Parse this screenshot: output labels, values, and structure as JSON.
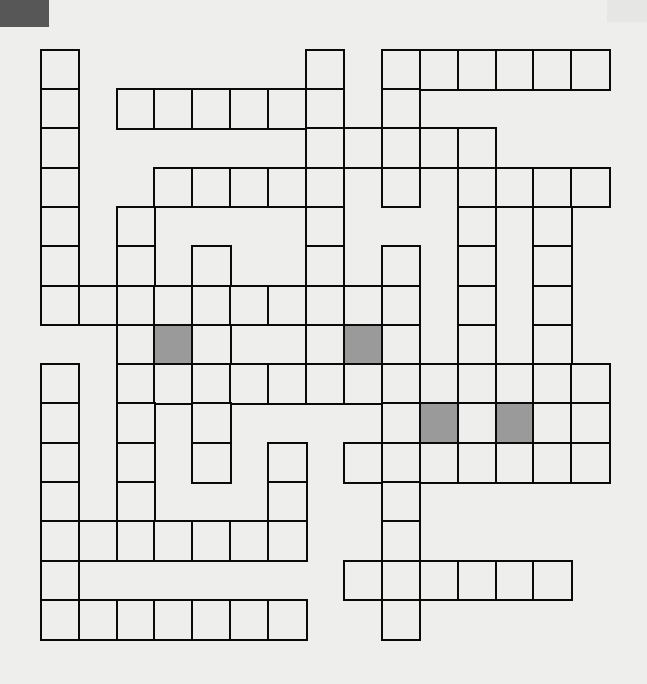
{
  "puzzle": {
    "type": "crossword",
    "rows": 15,
    "cols": 15,
    "origin": {
      "x": 41,
      "y": 50
    },
    "cell_width": 37.9,
    "cell_height": 39.3,
    "colors": {
      "background": "#eeeeec",
      "line": "#0a0a0a",
      "shaded": "#9a9a9a",
      "corner_mark": "#575757"
    },
    "grid": [
      {
        "row": 0,
        "cells": [
          0,
          7,
          9,
          10,
          11,
          12,
          13,
          14
        ],
        "shaded": []
      },
      {
        "row": 1,
        "cells": [
          0,
          2,
          3,
          4,
          5,
          6,
          7,
          9
        ],
        "shaded": []
      },
      {
        "row": 2,
        "cells": [
          0,
          7,
          8,
          9,
          10,
          11
        ],
        "shaded": []
      },
      {
        "row": 3,
        "cells": [
          0,
          3,
          4,
          5,
          6,
          7,
          9,
          11,
          12,
          13,
          14
        ],
        "shaded": []
      },
      {
        "row": 4,
        "cells": [
          0,
          2,
          7,
          11,
          13
        ],
        "shaded": []
      },
      {
        "row": 5,
        "cells": [
          0,
          2,
          4,
          7,
          9,
          11,
          13
        ],
        "shaded": []
      },
      {
        "row": 6,
        "cells": [
          0,
          1,
          2,
          3,
          4,
          5,
          6,
          7,
          8,
          9,
          11,
          13
        ],
        "shaded": []
      },
      {
        "row": 7,
        "cells": [
          2,
          3,
          4,
          7,
          8,
          9,
          11,
          13
        ],
        "shaded": [
          3,
          8
        ]
      },
      {
        "row": 8,
        "cells": [
          0,
          2,
          3,
          4,
          5,
          6,
          7,
          8,
          9,
          10,
          11,
          12,
          13,
          14
        ],
        "shaded": []
      },
      {
        "row": 9,
        "cells": [
          0,
          2,
          4,
          9,
          10,
          11,
          12,
          13,
          14
        ],
        "shaded": [
          10,
          12
        ]
      },
      {
        "row": 10,
        "cells": [
          0,
          2,
          4,
          6,
          8,
          9,
          10,
          11,
          12,
          13,
          14
        ],
        "shaded": []
      },
      {
        "row": 11,
        "cells": [
          0,
          2,
          6,
          9
        ],
        "shaded": []
      },
      {
        "row": 12,
        "cells": [
          0,
          1,
          2,
          3,
          4,
          5,
          6,
          9
        ],
        "shaded": []
      },
      {
        "row": 13,
        "cells": [
          0,
          8,
          9,
          10,
          11,
          12,
          13
        ],
        "shaded": []
      },
      {
        "row": 14,
        "cells": [
          0,
          1,
          2,
          3,
          4,
          5,
          6,
          9
        ],
        "shaded": []
      }
    ]
  }
}
